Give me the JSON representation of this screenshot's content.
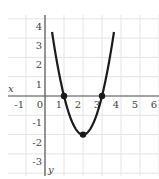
{
  "chart_data": {
    "type": "line",
    "title": "",
    "xlabel": "x",
    "ylabel": "y",
    "xlim": [
      -2,
      6
    ],
    "ylim": [
      -4,
      4.3
    ],
    "grid": true,
    "x_ticks": [
      "-1",
      "0",
      "1",
      "2",
      "3",
      "4",
      "5",
      "6"
    ],
    "y_ticks": [
      "4",
      "3",
      "2",
      "1",
      "-1",
      "-2",
      "-3"
    ],
    "series": [
      {
        "name": "parabola",
        "function": "y = 2(x-1)(x-3)",
        "x": [
          0.37,
          0.5,
          1,
          1.5,
          2,
          2.5,
          3,
          3.5,
          3.63
        ],
        "y": [
          4.3,
          2.5,
          0,
          -1.5,
          -2,
          -1.5,
          0,
          2.5,
          4.3
        ]
      }
    ],
    "marked_points": [
      {
        "label": "root-1",
        "x": 1,
        "y": 0
      },
      {
        "label": "vertex",
        "x": 2,
        "y": -2
      },
      {
        "label": "root-2",
        "x": 3,
        "y": 0
      }
    ]
  }
}
